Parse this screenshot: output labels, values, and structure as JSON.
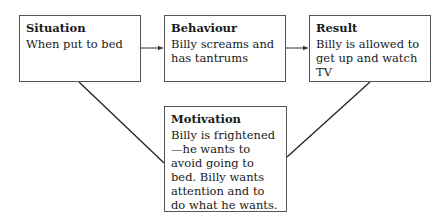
{
  "diagram": {
    "nodes": [
      {
        "id": "situation",
        "title": "Situation",
        "text": "When put to bed"
      },
      {
        "id": "behaviour",
        "title": "Behaviour",
        "text": "Billy screams and has tantrums"
      },
      {
        "id": "result",
        "title": "Result",
        "text": "Billy is allowed to get up and watch TV"
      },
      {
        "id": "motivation",
        "title": "Motivation",
        "text": "Billy is frightened—he wants to avoid going to bed. Billy wants attention and to do what he wants."
      }
    ],
    "edges": [
      {
        "from": "situation",
        "to": "behaviour",
        "type": "arrow"
      },
      {
        "from": "behaviour",
        "to": "result",
        "type": "arrow"
      },
      {
        "from": "situation",
        "to": "motivation",
        "type": "line"
      },
      {
        "from": "result",
        "to": "motivation",
        "type": "line"
      }
    ],
    "colors": {
      "line": "#222222",
      "border": "#555555",
      "background": "#ffffff"
    }
  }
}
